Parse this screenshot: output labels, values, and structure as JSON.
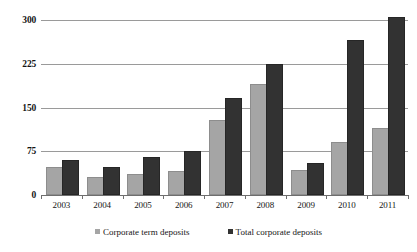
{
  "chart_data": {
    "type": "bar",
    "title": "",
    "subtitle": "",
    "xlabel": "",
    "ylabel": "",
    "categories": [
      "2003",
      "2004",
      "2005",
      "2006",
      "2007",
      "2008",
      "2009",
      "2010",
      "2011"
    ],
    "series": [
      {
        "name": "Corporate term deposits",
        "color": "#a5a5a5",
        "values": [
          45,
          28,
          33,
          38,
          125,
          187,
          39,
          88,
          112
        ]
      },
      {
        "name": "Total corporate deposits",
        "color": "#323232",
        "values": [
          57,
          45,
          62,
          72,
          163,
          221,
          51,
          262,
          301
        ]
      }
    ],
    "ylim": [
      0,
      300
    ],
    "yticks": [
      0,
      75,
      150,
      225,
      300
    ],
    "ytick_labels": [
      "0",
      "75",
      "150",
      "225",
      "300"
    ],
    "grid": true,
    "grid_axis": "y",
    "legend_position": "bottom",
    "legend": [
      "Corporate term deposits",
      "Total corporate deposits"
    ]
  },
  "axes": {
    "y_tick_labels": [
      "300",
      "225",
      "150",
      "75",
      "0"
    ],
    "x_tick_labels": [
      "2003",
      "2004",
      "2005",
      "2006",
      "2007",
      "2008",
      "2009",
      "2010",
      "2011"
    ]
  },
  "legend": {
    "items": [
      {
        "label": "Corporate term deposits",
        "marker": "square-gray-marker"
      },
      {
        "label": "Total corporate deposits",
        "marker": "square-dark-marker"
      }
    ]
  },
  "colors": {
    "series_corporate_term": "#a5a5a5",
    "series_total_corporate": "#323232",
    "gridline": "#9a9a9a",
    "axis": "#6e6e6e",
    "background": "#ffffff",
    "text": "#151515"
  }
}
